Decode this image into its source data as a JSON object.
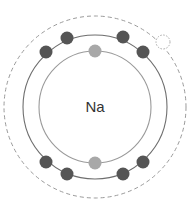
{
  "diagram": {
    "type": "bohr-model",
    "element_symbol": "Na",
    "center": {
      "x": 95,
      "y": 107
    },
    "colors": {
      "background": "#ffffff",
      "shell_inner": "#9a9a9a",
      "shell_outer": "#6e6e6e",
      "shell_dashed": "#9a9a9a",
      "electron_dark": "#555555",
      "electron_light": "#a8a8a8",
      "vacancy": "#a0a0a0",
      "label": "#333333"
    },
    "shells": [
      {
        "name": "inner-shell",
        "radius": 56,
        "style": "solid",
        "electrons": 2
      },
      {
        "name": "outer-shell",
        "radius": 72,
        "style": "solid",
        "electrons": 8
      },
      {
        "name": "valence-shell",
        "radius": 91,
        "style": "dashed",
        "electrons": 0,
        "vacancies": 1
      }
    ],
    "electrons": [
      {
        "shell": "inner",
        "x": 95,
        "y": 51,
        "shade": "light"
      },
      {
        "shell": "inner",
        "x": 95,
        "y": 163,
        "shade": "light"
      },
      {
        "shell": "outer",
        "x": 46,
        "y": 52,
        "shade": "dark"
      },
      {
        "shell": "outer",
        "x": 67,
        "y": 38,
        "shade": "dark"
      },
      {
        "shell": "outer",
        "x": 123,
        "y": 37,
        "shade": "dark"
      },
      {
        "shell": "outer",
        "x": 143,
        "y": 52,
        "shade": "dark"
      },
      {
        "shell": "outer",
        "x": 46,
        "y": 162,
        "shade": "dark"
      },
      {
        "shell": "outer",
        "x": 67,
        "y": 174,
        "shade": "dark"
      },
      {
        "shell": "outer",
        "x": 123,
        "y": 174,
        "shade": "dark"
      },
      {
        "shell": "outer",
        "x": 143,
        "y": 162,
        "shade": "dark"
      }
    ],
    "vacancy": {
      "x": 163,
      "y": 42,
      "radius": 7
    }
  }
}
